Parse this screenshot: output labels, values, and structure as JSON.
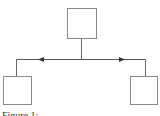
{
  "diagram": {
    "type": "tree",
    "nodes": [
      {
        "id": "top",
        "label": "",
        "x": 67,
        "y": 8,
        "w": 29,
        "h": 30
      },
      {
        "id": "left",
        "label": "",
        "x": 3,
        "y": 76,
        "w": 29,
        "h": 29
      },
      {
        "id": "right",
        "label": "",
        "x": 130,
        "y": 76,
        "w": 28,
        "h": 29
      }
    ],
    "edges": [
      {
        "from": "top",
        "to": "left",
        "arrow": "left"
      },
      {
        "from": "top",
        "to": "right",
        "arrow": "right"
      }
    ],
    "colors": {
      "stroke": "#7a7a7a",
      "line": "#555555",
      "fill": "#ffffff"
    }
  },
  "caption": "Figure 1: ..."
}
